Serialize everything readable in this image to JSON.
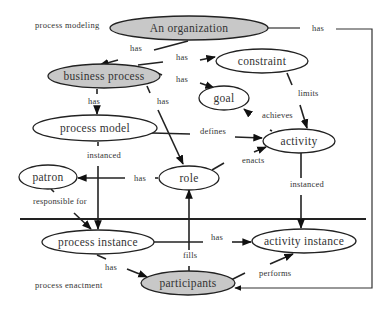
{
  "colors": {
    "highlight_fill": "#c8c8c8",
    "plain_fill": "#ffffff",
    "stroke": "#222222",
    "text": "#333333"
  },
  "regions": {
    "modeling": "process modeling",
    "enactment": "process enactment"
  },
  "nodes": {
    "organization": {
      "label": "An organization",
      "highlighted": true
    },
    "business_process": {
      "label": "business process",
      "highlighted": true
    },
    "constraint": {
      "label": "constraint",
      "highlighted": false
    },
    "goal": {
      "label": "goal",
      "highlighted": false
    },
    "process_model": {
      "label": "process model",
      "highlighted": false
    },
    "activity": {
      "label": "activity",
      "highlighted": false
    },
    "patron": {
      "label": "patron",
      "highlighted": false
    },
    "role": {
      "label": "role",
      "highlighted": false
    },
    "process_instance": {
      "label": "process instance",
      "highlighted": false
    },
    "activity_instance": {
      "label": "activity instance",
      "highlighted": false
    },
    "participants": {
      "label": "participants",
      "highlighted": true
    }
  },
  "edges": [
    {
      "id": "org_bp",
      "from": "An organization",
      "to": "business process",
      "label": "has"
    },
    {
      "id": "bp_constraint",
      "from": "business process",
      "to": "constraint",
      "label": "has"
    },
    {
      "id": "bp_goal",
      "from": "business process",
      "to": "goal",
      "label": "has"
    },
    {
      "id": "bp_pm",
      "from": "business process",
      "to": "process model",
      "label": "has"
    },
    {
      "id": "bp_role",
      "from": "business process",
      "to": "role",
      "label": "has"
    },
    {
      "id": "org_participants",
      "from": "An organization",
      "to": "participants",
      "label": "has"
    },
    {
      "id": "constraint_activity",
      "from": "constraint",
      "to": "activity",
      "label": "limits"
    },
    {
      "id": "activity_goal",
      "from": "activity",
      "to": "goal",
      "label": "achieves"
    },
    {
      "id": "pm_activity",
      "from": "process model",
      "to": "activity",
      "label": "defines"
    },
    {
      "id": "role_activity",
      "from": "role",
      "to": "activity",
      "label": "enacts"
    },
    {
      "id": "pm_pi",
      "from": "process model",
      "to": "process instance",
      "label": "instanced"
    },
    {
      "id": "role_patron",
      "from": "role",
      "to": "patron",
      "label": "has"
    },
    {
      "id": "patron_pi",
      "from": "patron",
      "to": "process instance",
      "label": "responsible for"
    },
    {
      "id": "activity_ai",
      "from": "activity",
      "to": "activity instance",
      "label": "instanced"
    },
    {
      "id": "pi_ai",
      "from": "process instance",
      "to": "activity instance",
      "label": "has"
    },
    {
      "id": "participants_role",
      "from": "participants",
      "to": "role",
      "label": "fills"
    },
    {
      "id": "pi_participants",
      "from": "process instance",
      "to": "participants",
      "label": "has"
    },
    {
      "id": "participants_ai",
      "from": "participants",
      "to": "activity instance",
      "label": "performs"
    }
  ],
  "edge_labels": {
    "org_bp": "has",
    "bp_constraint": "has",
    "bp_goal": "has",
    "bp_pm": "has",
    "bp_role": "has",
    "org_participants": "has",
    "constraint_activity": "limits",
    "activity_goal": "achieves",
    "pm_activity": "defines",
    "role_activity": "enacts",
    "pm_pi": "instanced",
    "role_patron": "has",
    "patron_pi": "responsible for",
    "activity_ai": "instanced",
    "pi_ai": "has",
    "participants_role": "fills",
    "pi_participants": "has",
    "participants_ai": "performs"
  }
}
